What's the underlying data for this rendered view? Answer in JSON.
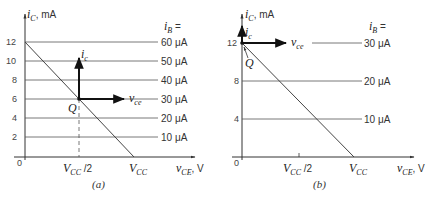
{
  "figure": {
    "panels": [
      {
        "id": "a",
        "caption": "(a)",
        "y_axis_label": "i_C, mA",
        "y_ticks": [
          "0",
          "2",
          "4",
          "6",
          "8",
          "10",
          "12"
        ],
        "x_ticks": [
          "V_CC/2",
          "V_CC"
        ],
        "x_axis_label": "v_CE, V",
        "ib_header": "i_B =",
        "curves": [
          "60 μA",
          "50 μA",
          "40 μA",
          "30 μA",
          "20 μA",
          "10 μA"
        ],
        "q_point": "Q",
        "signal_labels": {
          "ic": "i_c",
          "vce": "v_ce"
        }
      },
      {
        "id": "b",
        "caption": "(b)",
        "y_axis_label": "i_C, mA",
        "y_ticks": [
          "0",
          "4",
          "8",
          "12"
        ],
        "x_ticks": [
          "V_CC/2",
          "V_CC"
        ],
        "x_axis_label": "v_CE, V",
        "ib_header": "i_B =",
        "curves": [
          "30 μA",
          "20 μA",
          "10 μA"
        ],
        "q_point": "Q",
        "signal_labels": {
          "ic": "i_c",
          "vce": "v_ce"
        }
      }
    ]
  },
  "text": {
    "a_ylabel_main": "i",
    "a_ylabel_sub": "C",
    "a_ylabel_unit": ", mA",
    "a_ib": "i",
    "a_ib_sub": "B",
    "a_ib_eq": " =",
    "a_t12": "12",
    "a_t10": "10",
    "a_t8": "8",
    "a_t6": "6",
    "a_t4": "4",
    "a_t2": "2",
    "a_t0": "0",
    "a_c60": "60 μA",
    "a_c50": "50 μA",
    "a_c40": "40 μA",
    "a_c30": "30 μA",
    "a_c20": "20 μA",
    "a_c10": "10 μA",
    "a_q": "Q",
    "a_ic": "i",
    "a_ic_sub": "c",
    "a_vce": "v",
    "a_vce_sub": "ce",
    "a_vcc2": "V",
    "a_vcc2_sub": "CC",
    "a_vcc2_tail": " /2",
    "a_vcc": "V",
    "a_vcc_sub": "CC",
    "a_xlabel": "v",
    "a_xlabel_sub": "CE",
    "a_xlabel_unit": ", V",
    "a_cap": "(a)",
    "b_ylabel_main": "i",
    "b_ylabel_sub": "C",
    "b_ylabel_unit": ", mA",
    "b_ib": "i",
    "b_ib_sub": "B",
    "b_ib_eq": " =",
    "b_t12": "12",
    "b_t8": "8",
    "b_t4": "4",
    "b_t0": "0",
    "b_c30": "30 μA",
    "b_c20": "20 μA",
    "b_c10": "10 μA",
    "b_q": "Q",
    "b_ic": "i",
    "b_ic_sub": "c",
    "b_vce": "v",
    "b_vce_sub": "ce",
    "b_vcc2": "V",
    "b_vcc2_sub": "CC",
    "b_vcc2_tail": " /2",
    "b_vcc": "V",
    "b_vcc_sub": "CC",
    "b_xlabel": "v",
    "b_xlabel_sub": "CE",
    "b_xlabel_unit": ", V",
    "b_cap": "(b)"
  },
  "colors": {
    "axis": "#333333",
    "grid_line": "#555555",
    "load_line": "#444444",
    "arrow": "#111111"
  }
}
